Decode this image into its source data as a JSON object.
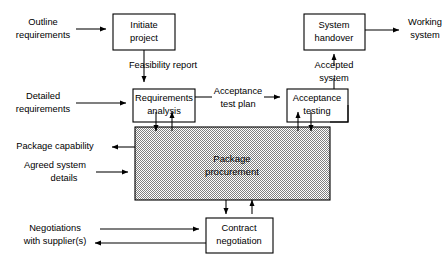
{
  "diagram": {
    "background_color": "#ffffff",
    "line_color": "#000000",
    "shaded_fill_color": "#b4b4b4",
    "nodes": [
      {
        "id": "initiate_project",
        "label_line1": "Initiate",
        "label_line2": "project"
      },
      {
        "id": "requirements_analysis",
        "label_line1": "Requirements",
        "label_line2": "analysis"
      },
      {
        "id": "acceptance_testing",
        "label_line1": "Acceptance",
        "label_line2": "testing"
      },
      {
        "id": "system_handover",
        "label_line1": "System",
        "label_line2": "handover"
      },
      {
        "id": "contract_negotiation",
        "label_line1": "Contract",
        "label_line2": "negotiation"
      },
      {
        "id": "package_procurement",
        "label_line1": "Package",
        "label_line2": "procurement"
      }
    ],
    "external_labels": [
      {
        "id": "outline_requirements",
        "line1": "Outline",
        "line2": "requirements"
      },
      {
        "id": "detailed_requirements",
        "line1": "Detailed",
        "line2": "requirements"
      },
      {
        "id": "package_capability",
        "line1": "Package capability",
        "line2": ""
      },
      {
        "id": "agreed_system_details",
        "line1": "Agreed system",
        "line2": "details"
      },
      {
        "id": "negotiations_supplier",
        "line1": "Negotiations",
        "line2": "with supplier(s)"
      },
      {
        "id": "working_system",
        "line1": "Working",
        "line2": "system"
      }
    ],
    "edge_labels": [
      {
        "id": "feasibility_report",
        "line1": "Feasibility report",
        "line2": ""
      },
      {
        "id": "acceptance_test_plan",
        "line1": "Acceptance",
        "line2": "test plan"
      },
      {
        "id": "accepted_system",
        "line1": "Accepted",
        "line2": "system"
      }
    ]
  }
}
